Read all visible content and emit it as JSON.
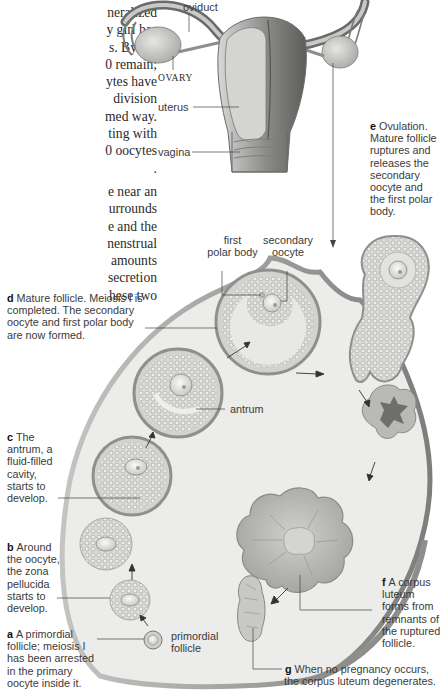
{
  "body_text": {
    "lines": [
      "neralized",
      "y girl has",
      "s. By the",
      "0 remain;",
      "ytes have",
      "division",
      "med way.",
      "ting with",
      "0 oocytes",
      ".",
      "",
      "e near an",
      "urrounds",
      "e and the",
      "nenstrual",
      "amounts",
      "secretion",
      "hese two"
    ]
  },
  "anatomy_labels": {
    "oviduct": "oviduct",
    "ovary": "OVARY",
    "uterus": "uterus",
    "vagina": "vagina"
  },
  "structure_labels": {
    "first_polar_body": [
      "first",
      "polar body"
    ],
    "secondary_oocyte": [
      "secondary",
      "oocyte"
    ],
    "antrum": "antrum",
    "primordial_follicle": [
      "primordial",
      "follicle"
    ]
  },
  "stages": [
    {
      "letter": "a",
      "lines": [
        "A primordial",
        "follicle; meiosis I",
        "has been arrested",
        "in the primary",
        "oocyte inside it."
      ]
    },
    {
      "letter": "b",
      "lines": [
        "Around",
        "the oocyte,",
        "the zona",
        "pellucida",
        "starts to",
        "develop."
      ]
    },
    {
      "letter": "c",
      "lines": [
        "The",
        "antrum, a",
        "fluid-filled",
        "cavity,",
        "starts to",
        "develop."
      ]
    },
    {
      "letter": "d",
      "lines": [
        "Mature follicle. Meiosis I is",
        "completed. The secondary",
        "oocyte and first polar body",
        "are now formed."
      ]
    },
    {
      "letter": "e",
      "lines": [
        "Ovulation.",
        "Mature follicle",
        "ruptures and",
        "releases the",
        "secondary",
        "oocyte and",
        "the first polar",
        "body."
      ]
    },
    {
      "letter": "f",
      "lines": [
        "A corpus",
        "luteum",
        "forms from",
        "remnants of",
        "the ruptured",
        "follicle."
      ]
    },
    {
      "letter": "g",
      "lines": [
        "When no pregnancy occurs,",
        "the corpus luteum degenerates."
      ]
    }
  ],
  "colors": {
    "ovary_fill": "#ececea",
    "ovary_edge": "#a9a9a6",
    "follicle_ring": "#9a9a98",
    "granulosa": "#d6d6d3",
    "corpus_luteum": "#b4b4b1",
    "corpus_dark": "#6e6e6c",
    "leader_line": "#444444"
  }
}
